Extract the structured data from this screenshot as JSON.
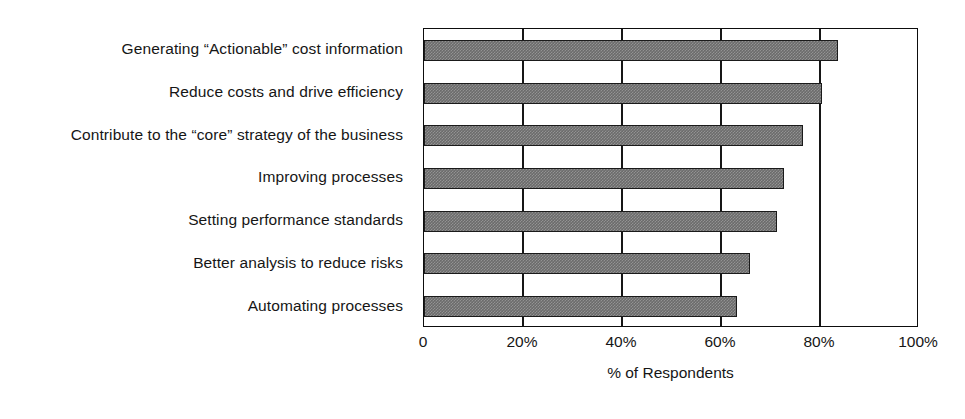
{
  "chart": {
    "type": "bar",
    "orientation": "horizontal",
    "xlabel": "% of Respondents",
    "ylabel": "",
    "title": "",
    "grid": true,
    "legend": false,
    "bar_color": "#6b6b6b",
    "bar_border_color": "#1a1a1a",
    "axis_color": "#0d0d0d"
  },
  "chart_data": {
    "type": "bar",
    "orientation": "horizontal",
    "title": "",
    "subtitle": "",
    "xlabel": "% of Respondents",
    "ylabel": "",
    "xlim": [
      0,
      100
    ],
    "xticks": [
      0,
      20,
      40,
      60,
      80,
      100
    ],
    "xtick_labels": [
      "0",
      "20%",
      "40%",
      "60%",
      "80%",
      "100%"
    ],
    "grid": true,
    "legend_position": "none",
    "categories": [
      "Generating “Actionable” cost information",
      "Reduce costs and drive efficiency",
      "Contribute to the “core” strategy of the business",
      "Improving processes",
      "Setting performance standards",
      "Better analysis to reduce risks",
      "Automating processes"
    ],
    "values": [
      83.6,
      80.4,
      76.6,
      72.7,
      71.3,
      65.9,
      63.2
    ],
    "value_unit": "%"
  }
}
